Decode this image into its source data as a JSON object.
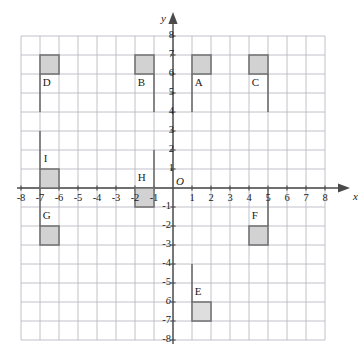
{
  "figure": {
    "type": "coordinate-grid-diagram",
    "axis_labels": {
      "x": "x",
      "y": "y",
      "origin": "O"
    },
    "x_ticks": [
      "-8",
      "-7",
      "-6",
      "-5",
      "-4",
      "-3",
      "-2",
      "-1",
      "1",
      "2",
      "3",
      "4",
      "5",
      "6",
      "7",
      "8"
    ],
    "y_ticks": [
      "8",
      "7",
      "6",
      "5",
      "4",
      "3",
      "2",
      "1",
      "-1",
      "-2",
      "-3",
      "-4",
      "-5",
      "6",
      "-7",
      "-8"
    ],
    "colors": {
      "grid": "#b9b9c4",
      "axis": "#4a4a4a",
      "shape_fill": "#d2d2d2",
      "shape_fill_light": "#dedede",
      "shape_stroke": "#6e6e6e",
      "text": "#1a1a1a",
      "background": "#ffffff"
    }
  },
  "chart_data": {
    "type": "scatter",
    "title": "",
    "xlabel": "x",
    "ylabel": "y",
    "xlim": [
      -8,
      8
    ],
    "ylim": [
      -8,
      8
    ],
    "grid": true,
    "legend": "none",
    "x_ticks": [
      -8,
      -7,
      -6,
      -5,
      -4,
      -3,
      -2,
      -1,
      1,
      2,
      3,
      4,
      5,
      6,
      7,
      8
    ],
    "y_ticks": [
      8,
      7,
      6,
      5,
      4,
      3,
      2,
      1,
      -1,
      -2,
      -3,
      -4,
      -5,
      -6,
      -7,
      -8
    ],
    "shapes": [
      {
        "label": "D",
        "square": {
          "x0": -7,
          "x1": -6,
          "y0": 6,
          "y1": 7
        },
        "stem": {
          "x": -7,
          "y0": 6,
          "y1": 4
        },
        "label_pos": {
          "x": -6.85,
          "y": 5.55
        },
        "fill": "#d2d2d2"
      },
      {
        "label": "B",
        "square": {
          "x0": -2,
          "x1": -1,
          "y0": 6,
          "y1": 7
        },
        "stem": {
          "x": -1,
          "y0": 6,
          "y1": 4
        },
        "label_pos": {
          "x": -1.85,
          "y": 5.55
        },
        "fill": "#d2d2d2"
      },
      {
        "label": "A",
        "square": {
          "x0": 1,
          "x1": 2,
          "y0": 6,
          "y1": 7
        },
        "stem": {
          "x": 1,
          "y0": 6,
          "y1": 4
        },
        "label_pos": {
          "x": 1.15,
          "y": 5.55
        },
        "fill": "#d2d2d2"
      },
      {
        "label": "C",
        "square": {
          "x0": 4,
          "x1": 5,
          "y0": 6,
          "y1": 7
        },
        "stem": {
          "x": 5,
          "y0": 6,
          "y1": 4
        },
        "label_pos": {
          "x": 4.15,
          "y": 5.55
        },
        "fill": "#d2d2d2"
      },
      {
        "label": "I",
        "square": {
          "x0": -7,
          "x1": -6,
          "y0": 0,
          "y1": 1
        },
        "stem": {
          "x": -7,
          "y0": 1,
          "y1": 3
        },
        "label_pos": {
          "x": -6.8,
          "y": 1.55
        },
        "fill": "#d2d2d2"
      },
      {
        "label": "H",
        "square": {
          "x0": -2,
          "x1": -1,
          "y0": -1,
          "y1": 0
        },
        "stem": {
          "x": -1,
          "y0": 0,
          "y1": 2
        },
        "label_pos": {
          "x": -1.85,
          "y": 0.55
        },
        "fill": "#d2d2d2"
      },
      {
        "label": "G",
        "square": {
          "x0": -7,
          "x1": -6,
          "y0": -3,
          "y1": -2
        },
        "stem": {
          "x": -7,
          "y0": -2,
          "y1": 0
        },
        "label_pos": {
          "x": -6.85,
          "y": -1.45
        },
        "fill": "#d2d2d2"
      },
      {
        "label": "F",
        "square": {
          "x0": 4,
          "x1": 5,
          "y0": -3,
          "y1": -2
        },
        "stem": {
          "x": 5,
          "y0": -2,
          "y1": 0
        },
        "label_pos": {
          "x": 4.15,
          "y": -1.45
        },
        "fill": "#d2d2d2"
      },
      {
        "label": "E",
        "square": {
          "x0": 1,
          "x1": 2,
          "y0": -7,
          "y1": -6
        },
        "stem": {
          "x": 1,
          "y0": -6,
          "y1": -4
        },
        "label_pos": {
          "x": 1.15,
          "y": -5.45
        },
        "fill": "#dedede"
      }
    ]
  }
}
